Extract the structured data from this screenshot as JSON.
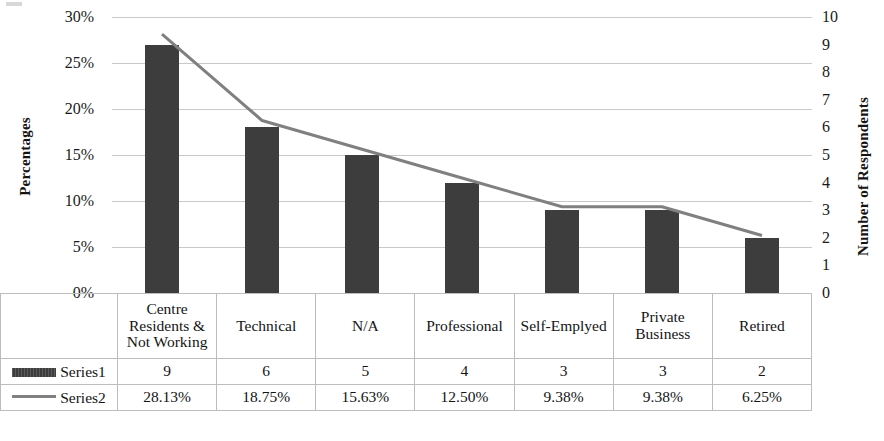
{
  "chart_data": {
    "type": "bar",
    "title": "",
    "subtitle": "",
    "xlabel": "",
    "ylabel": "Percentages",
    "y2label": "Number of Respondents",
    "categories": [
      "Centre Residents & Not Working",
      "Technical",
      "N/A",
      "Professional",
      "Self-Emplyed",
      "Private Business",
      "Retired"
    ],
    "series": [
      {
        "name": "Series1",
        "type": "bar",
        "axis": "right",
        "values": [
          9,
          6,
          5,
          4,
          3,
          3,
          2
        ],
        "labels": [
          "9",
          "6",
          "5",
          "4",
          "3",
          "3",
          "2"
        ],
        "color": "#3d3d3d"
      },
      {
        "name": "Series2",
        "type": "line",
        "axis": "left",
        "values": [
          28.13,
          18.75,
          15.63,
          12.5,
          9.38,
          9.38,
          6.25
        ],
        "labels": [
          "28.13%",
          "18.75%",
          "15.63%",
          "12.50%",
          "9.38%",
          "9.38%",
          "6.25%"
        ],
        "color": "#808080"
      }
    ],
    "ylim": [
      0,
      30
    ],
    "y2lim": [
      0,
      10
    ],
    "yticks": [
      0,
      5,
      10,
      15,
      20,
      25,
      30
    ],
    "ytick_labels": [
      "0%",
      "5%",
      "10%",
      "15%",
      "20%",
      "25%",
      "30%"
    ],
    "y2ticks": [
      0,
      1,
      2,
      3,
      4,
      5,
      6,
      7,
      8,
      9,
      10
    ],
    "y2tick_labels": [
      "0",
      "1",
      "2",
      "3",
      "4",
      "5",
      "6",
      "7",
      "8",
      "9",
      "10"
    ],
    "grid": true,
    "legend_position": "data-table-left"
  },
  "axes": {
    "left_title": "Percentages",
    "right_title": "Number of Respondents"
  },
  "data_table": {
    "category_row": [
      "Centre Residents & Not Working",
      "Technical",
      "N/A",
      "Professional",
      "Self-Emplyed",
      "Private Business",
      "Retired"
    ],
    "rows": [
      {
        "legend_label": "Series1",
        "marker": "bar-swatch",
        "cells": [
          "9",
          "6",
          "5",
          "4",
          "3",
          "3",
          "2"
        ]
      },
      {
        "legend_label": "Series2",
        "marker": "line-swatch",
        "cells": [
          "28.13%",
          "18.75%",
          "15.63%",
          "12.50%",
          "9.38%",
          "9.38%",
          "6.25%"
        ]
      }
    ]
  },
  "colors": {
    "bar": "#3d3d3d",
    "line": "#808080",
    "gridline": "#c9c9c9",
    "baseline": "#9a9a9a",
    "table_border": "#bdbdbd",
    "text": "#141414",
    "background": "#ffffff"
  }
}
